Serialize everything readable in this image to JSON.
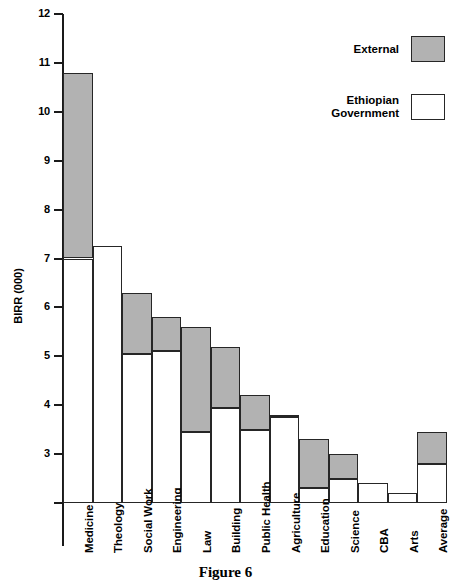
{
  "figure": {
    "caption": "Figure 6"
  },
  "legend": {
    "position": "top-right",
    "entries": [
      {
        "label": "External",
        "color": "#b2b2b2"
      },
      {
        "label": "Ethiopian\nGovernment",
        "color": "#ffffff"
      }
    ]
  },
  "chart_data": {
    "type": "bar",
    "subtype": "stacked-vertical",
    "title": "Figure 6",
    "xlabel": "",
    "ylabel": "BIRR (000)",
    "ylim": [
      2,
      12
    ],
    "grid": false,
    "legend_position": "top-right",
    "ytick_labels": [
      "12",
      "11",
      "10",
      "9",
      "8",
      "7",
      "6",
      "5",
      "4",
      "3",
      ""
    ],
    "yticks": [
      12,
      11,
      10,
      9,
      8,
      7,
      6,
      5,
      4,
      3,
      2
    ],
    "categories": [
      "Medicine",
      "Theology",
      "Social Work",
      "Engineering",
      "Law",
      "Building",
      "Public Health",
      "Agriculture",
      "Education",
      "Science",
      "CBA",
      "Arts",
      "Average"
    ],
    "series": [
      {
        "name": "Ethiopian Government",
        "color": "#ffffff",
        "values": [
          7.0,
          7.25,
          5.05,
          5.1,
          3.45,
          3.95,
          3.5,
          3.75,
          2.3,
          2.5,
          2.4,
          2.2,
          2.8
        ]
      },
      {
        "name": "External",
        "color": "#b2b2b2",
        "values": [
          3.8,
          0.0,
          1.25,
          0.7,
          2.15,
          1.25,
          0.7,
          0.05,
          1.0,
          0.5,
          0.0,
          0.0,
          0.65
        ]
      }
    ],
    "totals": [
      10.8,
      7.25,
      6.3,
      5.8,
      5.6,
      5.2,
      4.2,
      3.8,
      3.3,
      3.0,
      2.4,
      2.2,
      3.45
    ],
    "baseline": 2
  }
}
